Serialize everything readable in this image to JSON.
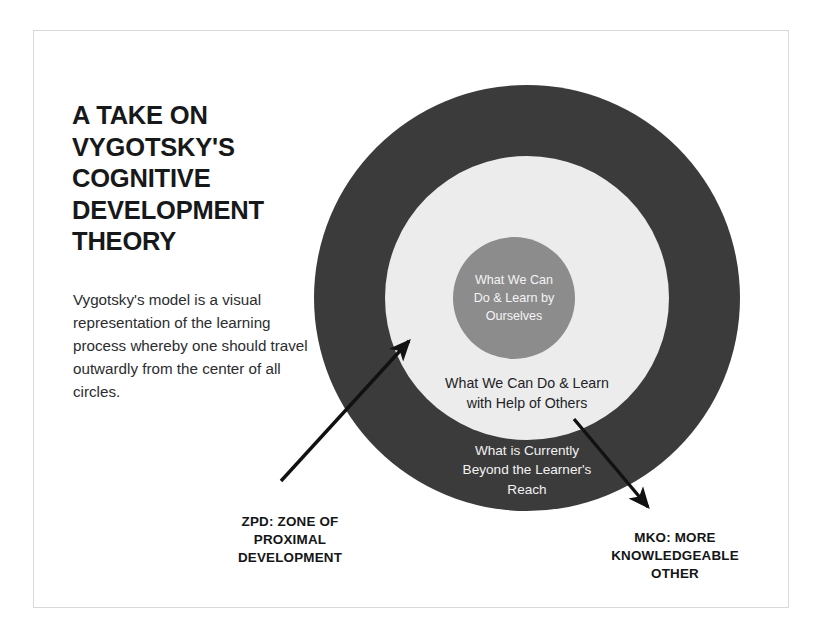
{
  "headline": "A Take On\nVygotsky's\nCognitive\nDevelopment\nTheory",
  "intro_paragraph": "Vygotsky's model is a visual representation of the learning process whereby one should travel outwardly from the center of all circles.",
  "diagram": {
    "rings": [
      {
        "id": "outer",
        "label": "What is Currently\nBeyond the Learner's\nReach",
        "fill": "#3b3b3b",
        "text_color": "#f2f2f2"
      },
      {
        "id": "middle",
        "label": "What We Can Do & Learn\nwith Help of Others",
        "fill": "#ececec",
        "text_color": "#222326"
      },
      {
        "id": "inner",
        "label": "What We Can\nDo & Learn by\nOurselves",
        "fill": "#8c8c8c",
        "text_color": "#f4f4f4"
      }
    ],
    "callouts": [
      {
        "id": "zpd",
        "text": "ZPD: Zone of\nProximal\nDevelopment"
      },
      {
        "id": "mko",
        "text": "MKO: More\nKnowledgeable\nOther"
      }
    ]
  },
  "colors": {
    "page_background": "#ffffff",
    "frame_border": "#d9d9d9",
    "outer_ring": "#3b3b3b",
    "middle_ring": "#ececec",
    "inner_circle": "#8c8c8c",
    "arrow": "#111111",
    "heading_text": "#17181a",
    "body_text": "#2c2d2f"
  }
}
